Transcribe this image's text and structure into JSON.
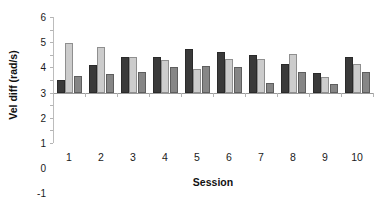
{
  "chart_data": {
    "type": "bar",
    "title": "",
    "subtitle": "",
    "xlabel": "Session",
    "ylabel": "Vel diff (rad/s)",
    "categories": [
      "1",
      "2",
      "3",
      "4",
      "5",
      "6",
      "7",
      "8",
      "9",
      "10"
    ],
    "ylim": [
      -4,
      6
    ],
    "ytick_step": 1,
    "yticks": [
      "6",
      "5",
      "4",
      "3",
      "2",
      "1",
      "0",
      "-1",
      "-2",
      "-3",
      "-4"
    ],
    "grid": false,
    "legend": "none",
    "series": [
      {
        "name": "series-1",
        "color": "#3a3a3a",
        "values": [
          1.0,
          2.2,
          2.8,
          2.8,
          3.5,
          3.25,
          2.95,
          2.3,
          1.55,
          2.85
        ]
      },
      {
        "name": "series-2",
        "color": "#cccccc",
        "values": [
          3.9,
          3.65,
          2.8,
          2.55,
          1.9,
          2.7,
          2.65,
          3.05,
          1.25,
          2.3
        ]
      },
      {
        "name": "series-3",
        "color": "#868686",
        "values": [
          1.3,
          1.5,
          1.65,
          2.05,
          2.15,
          2.0,
          0.8,
          1.6,
          0.65,
          1.6
        ]
      }
    ]
  }
}
